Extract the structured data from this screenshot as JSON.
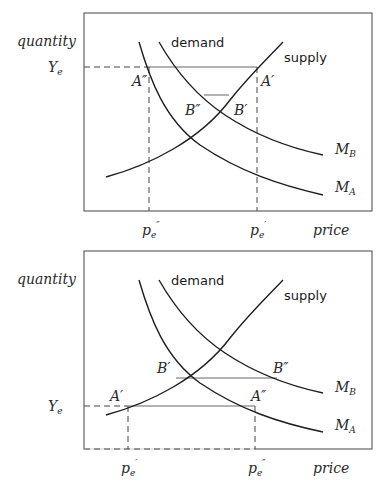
{
  "panels": [
    {
      "id": "top",
      "y_axis_label": "quantity",
      "x_axis_label": "price",
      "y_level_label": {
        "base": "Y",
        "sub": "e"
      },
      "curve_labels": {
        "demand": "demand",
        "supply": "supply",
        "mb": {
          "base": "M",
          "sub": "B"
        },
        "ma": {
          "base": "M",
          "sub": "A"
        }
      },
      "points": {
        "a1": "A″",
        "a2": "A′",
        "b1": "B″",
        "b2": "B′"
      },
      "x_ticks": [
        {
          "base": "p",
          "sub": "e",
          "prime": "″"
        },
        {
          "base": "p",
          "sub": "e",
          "prime": "′"
        }
      ]
    },
    {
      "id": "bottom",
      "y_axis_label": "quantity",
      "x_axis_label": "price",
      "y_level_label": {
        "base": "Y",
        "sub": "e"
      },
      "curve_labels": {
        "demand": "demand",
        "supply": "supply",
        "mb": {
          "base": "M",
          "sub": "B"
        },
        "ma": {
          "base": "M",
          "sub": "A"
        }
      },
      "points": {
        "a1": "A′",
        "a2": "A″",
        "b1": "B′",
        "b2": "B″"
      },
      "x_ticks": [
        {
          "base": "p",
          "sub": "e",
          "prime": "′"
        },
        {
          "base": "p",
          "sub": "e",
          "prime": "″"
        }
      ]
    }
  ]
}
